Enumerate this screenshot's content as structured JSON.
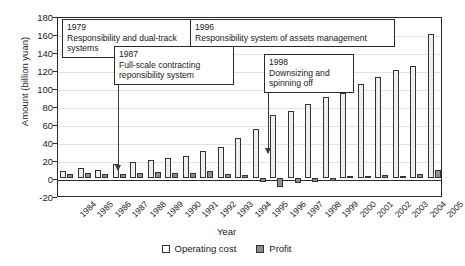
{
  "chart_data": {
    "type": "bar",
    "title": "",
    "xlabel": "Year",
    "ylabel": "Amount (billion yuan)",
    "ylim": [
      -20,
      180
    ],
    "ytick_step": 20,
    "yticks": [
      180,
      160,
      140,
      120,
      100,
      80,
      60,
      40,
      20,
      0,
      -20
    ],
    "grid": true,
    "legend_position": "bottom-center",
    "categories": [
      "1984",
      "1985",
      "1986",
      "1987",
      "1988",
      "1989",
      "1990",
      "1991",
      "1992",
      "1993",
      "1994",
      "1995",
      "1996",
      "1997",
      "1998",
      "1999",
      "2000",
      "2001",
      "2002",
      "2003",
      "2004",
      "2005"
    ],
    "series": [
      {
        "name": "Operating cost",
        "color": "#efefef",
        "values": [
          8,
          11,
          9,
          16,
          18,
          20,
          22,
          25,
          30,
          35,
          45,
          55,
          70,
          75,
          82,
          90,
          95,
          105,
          112,
          120,
          125,
          160
        ]
      },
      {
        "name": "Profit",
        "color": "#8d8d8d",
        "values": [
          5,
          6,
          5,
          5,
          6,
          7,
          6,
          6,
          8,
          5,
          3,
          -4,
          -10,
          -5,
          -4,
          -3,
          2,
          2,
          3,
          2,
          4,
          9
        ]
      }
    ],
    "annotations": [
      {
        "year": "1979",
        "text": "Responsibility and dual-track systems",
        "has_arrow": false
      },
      {
        "year": "1987",
        "text": "Full-scale contracting reponsibility system",
        "has_arrow": true
      },
      {
        "year": "1996",
        "text": "Responsibility system of assets management",
        "has_arrow": false
      },
      {
        "year": "1998",
        "text": "Downsizing and spinning off",
        "has_arrow": true
      }
    ]
  }
}
